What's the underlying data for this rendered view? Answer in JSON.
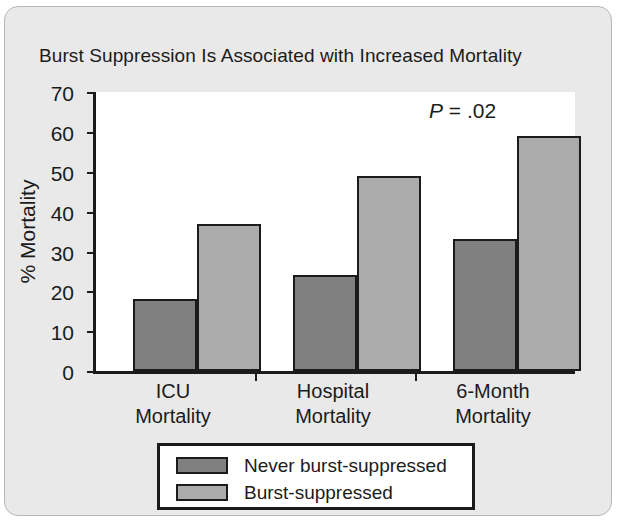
{
  "card": {
    "background_color": "#e9e9e9",
    "border_color": "#b8b8b8"
  },
  "chart_data": {
    "type": "bar",
    "title": "Burst Suppression Is Associated with Increased Mortality",
    "xlabel": "",
    "ylabel": "% Mortality",
    "ylim": [
      0,
      70
    ],
    "yticks": [
      0,
      10,
      20,
      30,
      40,
      50,
      60,
      70
    ],
    "ytick_labels": [
      "0",
      "10",
      "20",
      "30",
      "40",
      "50",
      "60",
      "70"
    ],
    "grid": false,
    "legend_position": "below-axes",
    "categories": [
      "ICU Mortality",
      "Hospital Mortality",
      "6-Month Mortality"
    ],
    "category_lines": [
      [
        "ICU",
        "Mortality"
      ],
      [
        "Hospital",
        "Mortality"
      ],
      [
        "6-Month",
        "Mortality"
      ]
    ],
    "series": [
      {
        "name": "Never burst-suppressed",
        "color": "#808080",
        "values": [
          18,
          24,
          33
        ]
      },
      {
        "name": "Burst-suppressed",
        "color": "#ababab",
        "values": [
          37,
          49,
          59
        ]
      }
    ],
    "annotations": [
      {
        "name": "p-value",
        "symbol": "P",
        "text": " = .02",
        "full_text": "P = .02"
      }
    ]
  }
}
